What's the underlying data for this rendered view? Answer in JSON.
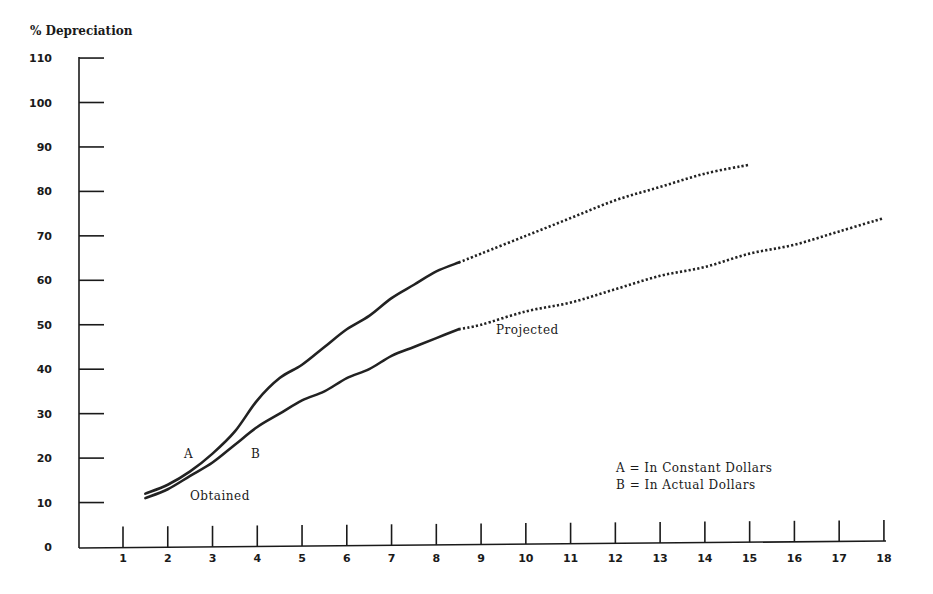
{
  "chart_data": {
    "type": "line",
    "title": "",
    "ylabel": "% Depreciation",
    "xlabel": "",
    "ylim": [
      0,
      110
    ],
    "xlim": [
      0,
      18
    ],
    "grid": false,
    "y_ticks": [
      0,
      10,
      20,
      30,
      40,
      50,
      60,
      70,
      80,
      90,
      100,
      110
    ],
    "x_ticks": [
      1,
      2,
      3,
      4,
      5,
      6,
      7,
      8,
      9,
      10,
      11,
      12,
      13,
      14,
      15,
      16,
      17,
      18
    ],
    "series": [
      {
        "name": "A",
        "label": "In Constant Dollars",
        "obtained": {
          "x": [
            1.5,
            2.0,
            2.5,
            3.0,
            3.5,
            4.0,
            4.5,
            5.0,
            5.5,
            6.0,
            6.5,
            7.0,
            7.5,
            8.0,
            8.5
          ],
          "y": [
            12,
            14,
            17,
            21,
            26,
            33,
            38,
            41,
            45,
            49,
            52,
            56,
            59,
            62,
            64
          ]
        },
        "projected": {
          "x": [
            8.5,
            9,
            10,
            11,
            12,
            13,
            14,
            15
          ],
          "y": [
            64,
            66,
            70,
            74,
            78,
            81,
            84,
            86
          ]
        }
      },
      {
        "name": "B",
        "label": "In Actual Dollars",
        "obtained": {
          "x": [
            1.5,
            2.0,
            2.5,
            3.0,
            3.5,
            4.0,
            4.5,
            5.0,
            5.5,
            6.0,
            6.5,
            7.0,
            7.5,
            8.0,
            8.5
          ],
          "y": [
            11,
            13,
            16,
            19,
            23,
            27,
            30,
            33,
            35,
            38,
            40,
            43,
            45,
            47,
            49
          ]
        },
        "projected": {
          "x": [
            8.5,
            9,
            10,
            11,
            12,
            13,
            14,
            15,
            16,
            17,
            18
          ],
          "y": [
            49,
            50,
            53,
            55,
            58,
            61,
            63,
            66,
            68,
            71,
            74
          ]
        }
      }
    ],
    "annotations": [
      {
        "text": "A",
        "x": 2.5,
        "y": 21
      },
      {
        "text": "B",
        "x": 4.0,
        "y": 21
      },
      {
        "text": "Obtained",
        "x": 2.5,
        "y": 11
      },
      {
        "text": "Projected",
        "x": 9.4,
        "y": 49
      }
    ],
    "legend": {
      "position": "lower-right",
      "entries": [
        "A = In Constant Dollars",
        "B = In Actual Dollars"
      ]
    }
  },
  "labels": {
    "y_axis_title": "% Depreciation",
    "curve_a": "A",
    "curve_b": "B",
    "obtained": "Obtained",
    "projected": "Projected",
    "legend_a": "A = In Constant Dollars",
    "legend_b": "B = In Actual Dollars"
  },
  "colors": {
    "ink": "#222222",
    "background": "#ffffff"
  }
}
